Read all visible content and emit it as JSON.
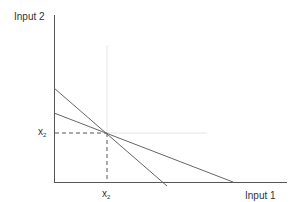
{
  "diagram": {
    "y_axis_label": "Input 2",
    "x_axis_label": "Input 1",
    "y_tick": {
      "base": "x",
      "sub": "2"
    },
    "x_tick": {
      "base": "x",
      "sub": "2"
    },
    "colors": {
      "axis": "#555555",
      "line": "#666666",
      "guide": "#e6e6e6",
      "dashed": "#555555",
      "text": "#333333"
    },
    "lines": [
      {
        "name": "steep-isoquant",
        "from": [
          54,
          88
        ],
        "to": [
          167,
          186
        ]
      },
      {
        "name": "shallow-isoquant",
        "from": [
          54,
          113
        ],
        "to": [
          233,
          182
        ]
      }
    ],
    "intersection": [
      107,
      133
    ]
  }
}
